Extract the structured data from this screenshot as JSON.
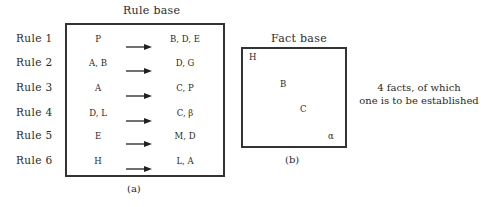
{
  "rule_base": {
    "title": "Rule base",
    "caption": "(a)",
    "rules": [
      {
        "label": "Rule 1",
        "premise": "P",
        "conclusion": "B, D, E"
      },
      {
        "label": "Rule 2",
        "premise": "A, B",
        "conclusion": "D, G"
      },
      {
        "label": "Rule 3",
        "premise": "A",
        "conclusion": "C, P"
      },
      {
        "label": "Rule 4",
        "premise": "D, L",
        "conclusion": "C, β"
      },
      {
        "label": "Rule 5",
        "premise": "E",
        "conclusion": "M, D"
      },
      {
        "label": "Rule 6",
        "premise": "H",
        "conclusion": "L, A"
      }
    ],
    "arrow_icon": "right-arrow-icon"
  },
  "fact_base": {
    "title": "Fact base",
    "caption": "(b)",
    "facts": [
      "H",
      "B",
      "C",
      "α"
    ],
    "note_line1": "4 facts, of which",
    "note_line2": "one is to be established"
  }
}
